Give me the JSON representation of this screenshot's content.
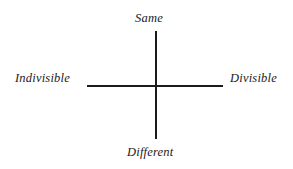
{
  "diagram": {
    "type": "conceptual-axis-cross",
    "background_color": "#ffffff",
    "line_color": "#1b1b1b",
    "text_color": "#1a1a1a",
    "axes": {
      "vertical": {
        "top_label": "Same",
        "bottom_label": "Different"
      },
      "horizontal": {
        "left_label": "Indivisible",
        "right_label": "Divisible"
      }
    },
    "labels": {
      "top": "Same",
      "bottom": "Different",
      "left": "Indivisible",
      "right": "Divisible"
    }
  }
}
